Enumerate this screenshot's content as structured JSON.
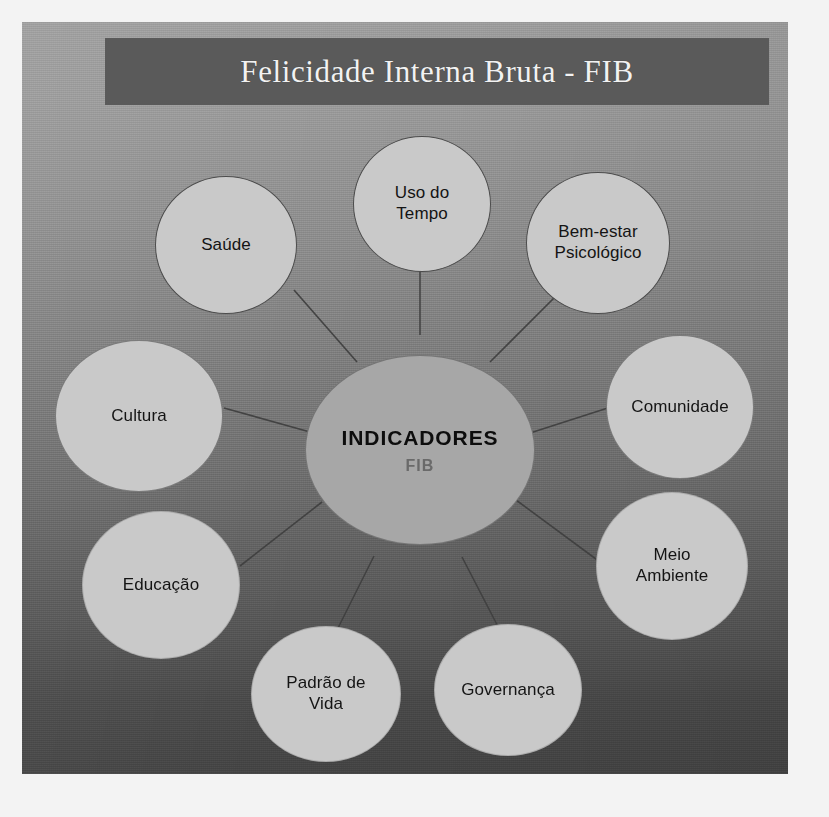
{
  "slide": {
    "title": "Felicidade Interna Bruta - FIB",
    "background_top_color": "#9d9d9d",
    "background_bottom_color": "#454545",
    "banner_color": "#5a5a5a",
    "title_color": "#f2f2f2"
  },
  "diagram": {
    "type": "hub-and-spoke",
    "node_fill": "#c9c9c9",
    "center_fill": "#a7a7a7",
    "connector_color": "#3f3f3f",
    "center": {
      "title": "INDICADORES",
      "subtitle": "FIB",
      "title_color": "#0d0d0d",
      "subtitle_color": "#6a6a6a"
    },
    "nodes": [
      {
        "id": "saude",
        "label": "Saúde"
      },
      {
        "id": "uso-do-tempo",
        "label": "Uso do\nTempo"
      },
      {
        "id": "bem-estar",
        "label": "Bem-estar\nPsicológico"
      },
      {
        "id": "comunidade",
        "label": "Comunidade"
      },
      {
        "id": "meio-ambiente",
        "label": "Meio\nAmbiente"
      },
      {
        "id": "governanca",
        "label": "Governança"
      },
      {
        "id": "padrao-de-vida",
        "label": "Padrão de\nVida"
      },
      {
        "id": "educacao",
        "label": "Educação"
      },
      {
        "id": "cultura",
        "label": "Cultura"
      }
    ]
  }
}
